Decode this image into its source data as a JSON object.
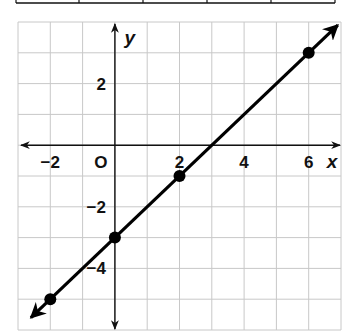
{
  "table_fragment": {
    "cells": 5,
    "dividers_px": [
      16,
      79,
      143,
      207,
      271,
      335
    ]
  },
  "chart_data": {
    "type": "line",
    "title": "",
    "xlabel": "x",
    "ylabel": "y",
    "xlim": [
      -3,
      7
    ],
    "ylim": [
      -6,
      4
    ],
    "grid": true,
    "x_tick_labels": [
      {
        "value": -2,
        "label": "−2"
      },
      {
        "value": 0,
        "label": "O"
      },
      {
        "value": 2,
        "label": "2"
      },
      {
        "value": 4,
        "label": "4"
      },
      {
        "value": 6,
        "label": "6"
      }
    ],
    "y_tick_labels": [
      {
        "value": 2,
        "label": "2"
      },
      {
        "value": -2,
        "label": "−2"
      },
      {
        "value": -4,
        "label": "−4"
      }
    ],
    "series": [
      {
        "name": "line",
        "equation": "y = x - 3",
        "points": [
          {
            "x": -2,
            "y": -5
          },
          {
            "x": 0,
            "y": -3
          },
          {
            "x": 2,
            "y": -1
          },
          {
            "x": 6,
            "y": 3
          }
        ],
        "arrows_both_ends": true
      }
    ],
    "colors": {
      "grid": "#c8c8c8",
      "axis": "#111111",
      "line": "#000000",
      "points": "#000000"
    }
  }
}
